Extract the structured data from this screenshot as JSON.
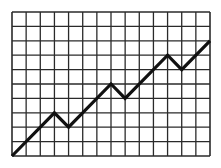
{
  "chart_data": {
    "type": "line",
    "title": "",
    "xlabel": "",
    "ylabel": "",
    "grid": true,
    "legend": null,
    "xlim": [
      0,
      14
    ],
    "ylim": [
      0,
      10
    ],
    "grid_columns": 14,
    "grid_rows": 10,
    "series": [
      {
        "name": "trend",
        "x": [
          0,
          3,
          4,
          7,
          8,
          11,
          12,
          14
        ],
        "y": [
          0,
          3,
          2,
          5,
          4,
          7,
          6,
          8
        ]
      }
    ],
    "colors": {
      "background": "#ffffff",
      "grid": "#2a2a2a",
      "line": "#111111"
    },
    "plot_area": {
      "left": 12,
      "top": 12,
      "right": 210,
      "bottom": 156
    }
  }
}
